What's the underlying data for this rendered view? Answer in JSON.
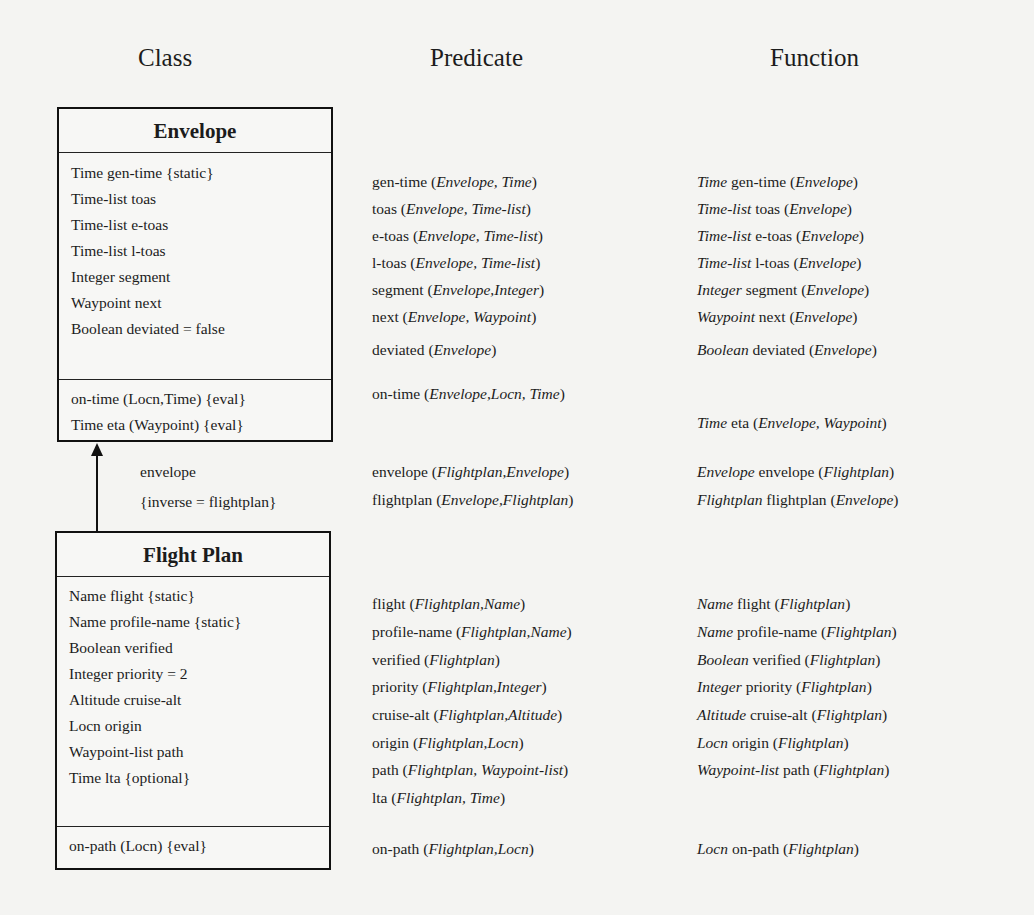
{
  "column_headers": {
    "class": "Class",
    "predicate": "Predicate",
    "function": "Function"
  },
  "envelope": {
    "title": "Envelope",
    "attributes": [
      "Time gen-time {static}",
      "Time-list toas",
      "Time-list e-toas",
      "Time-list l-toas",
      "Integer segment",
      "Waypoint next",
      "Boolean deviated = false"
    ],
    "operations": [
      "on-time (Locn,Time) {eval}",
      "Time eta (Waypoint) {eval}"
    ]
  },
  "association": {
    "role": "envelope",
    "constraint": "{inverse = flightplan}"
  },
  "flightplan": {
    "title": "Flight Plan",
    "attributes": [
      "Name flight {static}",
      "Name profile-name {static}",
      "Boolean verified",
      "Integer priority = 2",
      "Altitude cruise-alt",
      "Locn origin",
      "Waypoint-list path",
      "Time lta {optional}"
    ],
    "operations": [
      "on-path (Locn) {eval}"
    ]
  },
  "predicates": {
    "envelope_attrs": [
      {
        "name": "gen-time",
        "args": "Envelope, Time"
      },
      {
        "name": "toas",
        "args": "Envelope, Time-list"
      },
      {
        "name": "e-toas",
        "args": "Envelope, Time-list"
      },
      {
        "name": "l-toas",
        "args": "Envelope, Time-list"
      },
      {
        "name": "segment",
        "args": "Envelope,Integer"
      },
      {
        "name": "next",
        "args": "Envelope, Waypoint"
      },
      {
        "name": "deviated",
        "args": "Envelope"
      }
    ],
    "envelope_ops": [
      {
        "name": "on-time",
        "args": "Envelope,Locn, Time"
      }
    ],
    "association": [
      {
        "name": "envelope",
        "args": "Flightplan,Envelope"
      },
      {
        "name": "flightplan",
        "args": "Envelope,Flightplan"
      }
    ],
    "flightplan_attrs": [
      {
        "name": "flight",
        "args": "Flightplan,Name"
      },
      {
        "name": "profile-name",
        "args": "Flightplan,Name"
      },
      {
        "name": "verified",
        "args": "Flightplan"
      },
      {
        "name": "priority",
        "args": "Flightplan,Integer"
      },
      {
        "name": "cruise-alt",
        "args": "Flightplan,Altitude"
      },
      {
        "name": "origin",
        "args": "Flightplan,Locn"
      },
      {
        "name": "path",
        "args": "Flightplan, Waypoint-list"
      },
      {
        "name": "lta",
        "args": "Flightplan, Time"
      }
    ],
    "flightplan_ops": [
      {
        "name": "on-path",
        "args": "Flightplan,Locn"
      }
    ]
  },
  "functions": {
    "envelope_attrs": [
      {
        "type": "Time",
        "name": "gen-time",
        "args": "Envelope"
      },
      {
        "type": "Time-list",
        "name": "toas",
        "args": "Envelope"
      },
      {
        "type": "Time-list",
        "name": "e-toas",
        "args": "Envelope"
      },
      {
        "type": "Time-list",
        "name": "l-toas",
        "args": "Envelope"
      },
      {
        "type": "Integer",
        "name": "segment",
        "args": "Envelope"
      },
      {
        "type": "Waypoint",
        "name": "next",
        "args": "Envelope"
      },
      {
        "type": "Boolean",
        "name": "deviated",
        "args": "Envelope"
      }
    ],
    "envelope_ops": [
      {
        "type": "Time",
        "name": "eta",
        "args": "Envelope, Waypoint"
      }
    ],
    "association": [
      {
        "type": "Envelope",
        "name": "envelope",
        "args": "Flightplan"
      },
      {
        "type": "Flightplan",
        "name": "flightplan",
        "args": "Envelope"
      }
    ],
    "flightplan_attrs": [
      {
        "type": "Name",
        "name": "flight",
        "args": "Flightplan"
      },
      {
        "type": "Name",
        "name": "profile-name",
        "args": "Flightplan"
      },
      {
        "type": "Boolean",
        "name": "verified",
        "args": "Flightplan"
      },
      {
        "type": "Integer",
        "name": "priority",
        "args": "Flightplan"
      },
      {
        "type": "Altitude",
        "name": "cruise-alt",
        "args": "Flightplan"
      },
      {
        "type": "Locn",
        "name": "origin",
        "args": "Flightplan"
      },
      {
        "type": "Waypoint-list",
        "name": "path",
        "args": "Flightplan"
      }
    ],
    "flightplan_ops": [
      {
        "type": "Locn",
        "name": "on-path",
        "args": "Flightplan"
      }
    ]
  }
}
